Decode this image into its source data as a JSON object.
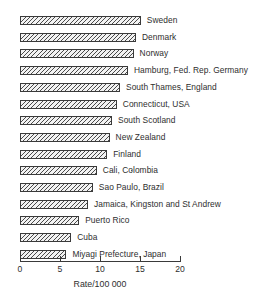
{
  "chart_data": {
    "type": "bar",
    "orientation": "horizontal",
    "title": "",
    "xlabel": "Rate/100 000",
    "ylabel": "",
    "xlim": [
      0,
      20
    ],
    "ticks": [
      "0",
      "5",
      "10",
      "15",
      "20"
    ],
    "tick_values": [
      0,
      5,
      10,
      15,
      20
    ],
    "grid": false,
    "legend": null,
    "categories": [
      "Sweden",
      "Denmark",
      "Norway",
      "Hamburg, Fed. Rep. Germany",
      "South Thames, England",
      "Connecticut, USA",
      "South Scotland",
      "New Zealand",
      "Finland",
      "Cali, Colombia",
      "Sao Paulo, Brazil",
      "Jamaica, Kingston and St Andrew",
      "Puerto Rico",
      "Cuba",
      "Miyagi Prefecture, Japan"
    ],
    "values": [
      15.1,
      14.5,
      14.2,
      13.5,
      12.5,
      12.1,
      11.5,
      11.2,
      10.9,
      9.6,
      9.1,
      8.5,
      7.4,
      6.4,
      5.8
    ]
  }
}
